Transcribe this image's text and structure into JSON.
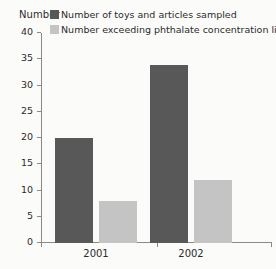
{
  "chart_data": {
    "type": "bar",
    "title": "",
    "xlabel": "",
    "ylabel": "Number",
    "categories": [
      "2001",
      "2002"
    ],
    "ylim": [
      0,
      40
    ],
    "yticks": [
      0,
      5,
      10,
      15,
      20,
      25,
      30,
      35,
      40
    ],
    "ytick_labels": [
      "0",
      "5",
      "10",
      "15",
      "20",
      "25",
      "30",
      "35",
      "40"
    ],
    "grid": false,
    "legend_position": "top-right",
    "series": [
      {
        "name": "Number of toys and articles sampled",
        "color": "#585858",
        "values": [
          20,
          34
        ]
      },
      {
        "name": "Number exceeding phthalate concentration limits",
        "color": "#c4c4c4",
        "values": [
          8,
          12
        ]
      }
    ]
  },
  "colors": {
    "series_dark": "#585858",
    "series_light": "#c4c4c4",
    "axis": "#8a8a8a",
    "text": "#2b2b2b",
    "background": "#fbfbfa"
  }
}
